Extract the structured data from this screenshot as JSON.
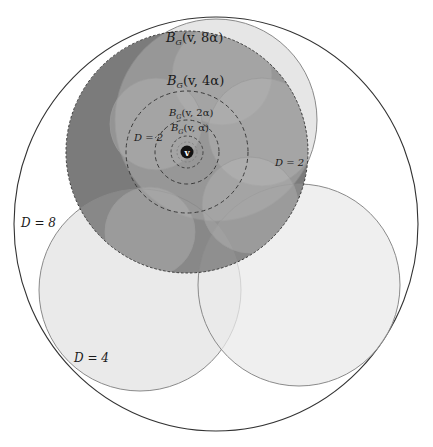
{
  "figure": {
    "type": "nested-balls-diagram",
    "center_point": {
      "label": "v",
      "x": 187,
      "y": 152
    },
    "outer_circle": {
      "label": "D = 8",
      "cx": 216,
      "cy": 224,
      "rx": 202,
      "ry": 207
    },
    "balls": [
      {
        "id": "B8",
        "label": "B_G(v, 8α)",
        "label_parts": [
          "B",
          "G",
          "(v, 8α)"
        ],
        "r": 121,
        "fill": "#7b7b7b",
        "style": "dashed"
      },
      {
        "id": "B4",
        "label": "B_G(v, 4α)",
        "label_parts": [
          "B",
          "G",
          "(v, 4α)"
        ],
        "r": 61,
        "style": "dashed"
      },
      {
        "id": "B2",
        "label": "B_G(v, 2α)",
        "label_parts": [
          "B",
          "G",
          "(v, 2α)"
        ],
        "r": 32,
        "style": "dashed"
      },
      {
        "id": "B1",
        "label": "B_G(v, α)",
        "label_parts": [
          "B",
          "G",
          "(v, α)"
        ],
        "r": 16,
        "style": "dashed"
      }
    ],
    "clusters_d4": [
      {
        "label": "",
        "cx": 216,
        "cy": 120,
        "r": 101
      },
      {
        "label": "D = 4",
        "cx": 140,
        "cy": 290,
        "r": 101
      },
      {
        "label": "",
        "cx": 299,
        "cy": 285,
        "r": 101
      }
    ],
    "clusters_d2": [
      {
        "label": "D = 2",
        "cx": 156,
        "cy": 124,
        "r": 46
      },
      {
        "label": "D = 2",
        "cx": 262,
        "cy": 132,
        "r": 54
      },
      {
        "label": "",
        "cx": 222,
        "cy": 75,
        "r": 50
      },
      {
        "label": "",
        "cx": 150,
        "cy": 232,
        "r": 45
      },
      {
        "label": "",
        "cx": 250,
        "cy": 205,
        "r": 48
      }
    ],
    "labels": {
      "b8": "(v, 8α)",
      "b4": "(v, 4α)",
      "b2": "(v, 2α)",
      "b1": "(v, α)",
      "b_main": "B",
      "b_sub": "G",
      "d8": "D = 8",
      "d4": "D = 4",
      "d2_left": "D = 2",
      "d2_right": "D = 2",
      "v": "v"
    },
    "colors": {
      "outer_stroke": "#333333",
      "dark_ball": "#7b7b7b",
      "cluster_d4_fill": "#e9e9e9",
      "cluster_d2_fill": "#b8b8b8",
      "cluster_stroke": "#8a8a8a",
      "dashed_stroke": "#3a3a3a",
      "point_fill": "#111111"
    }
  }
}
